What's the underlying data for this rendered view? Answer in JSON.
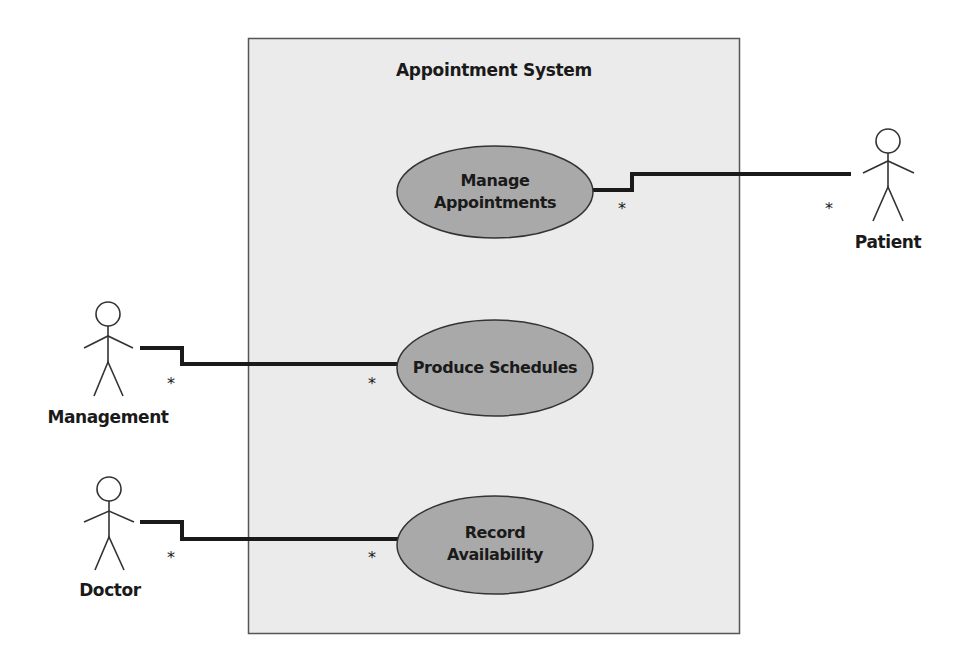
{
  "diagram": {
    "type": "uml-use-case",
    "system": {
      "title": "Appointment System",
      "box": {
        "x": 248,
        "y": 38,
        "width": 492,
        "height": 596
      },
      "fill": "#ebebeb",
      "stroke": "#555555"
    },
    "use_cases": [
      {
        "id": "manage-appointments",
        "lines": [
          "Manage",
          "Appointments"
        ],
        "cx": 495,
        "cy": 192,
        "rx": 98,
        "ry": 46
      },
      {
        "id": "produce-schedules",
        "lines": [
          "Produce Schedules"
        ],
        "cx": 495,
        "cy": 368,
        "rx": 98,
        "ry": 48
      },
      {
        "id": "record-availability",
        "lines": [
          "Record",
          "Availability"
        ],
        "cx": 495,
        "cy": 545,
        "rx": 98,
        "ry": 49
      }
    ],
    "use_case_fill": "#a9a9a9",
    "use_case_stroke": "#333333",
    "actors": [
      {
        "id": "patient",
        "label": "Patient"
      },
      {
        "id": "management",
        "label": "Management"
      },
      {
        "id": "doctor",
        "label": "Doctor"
      }
    ],
    "associations": [
      {
        "actor": "patient",
        "use_case": "manage-appointments",
        "actor_multiplicity": "*",
        "use_case_multiplicity": "*"
      },
      {
        "actor": "management",
        "use_case": "produce-schedules",
        "actor_multiplicity": "*",
        "use_case_multiplicity": "*"
      },
      {
        "actor": "doctor",
        "use_case": "record-availability",
        "actor_multiplicity": "*",
        "use_case_multiplicity": "*"
      }
    ]
  },
  "labels": {
    "system_title": "Appointment System",
    "uc_manage_line1": "Manage",
    "uc_manage_line2": "Appointments",
    "uc_produce": "Produce Schedules",
    "uc_record_line1": "Record",
    "uc_record_line2": "Availability",
    "actor_patient": "Patient",
    "actor_management": "Management",
    "actor_doctor": "Doctor",
    "multiplicity": "*"
  }
}
